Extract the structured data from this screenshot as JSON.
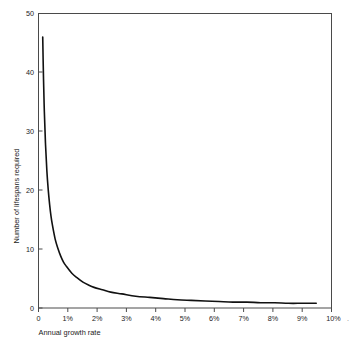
{
  "chart_data": {
    "type": "line",
    "title": "",
    "xlabel": "Annual growth rate",
    "ylabel": "Number of lifespans required",
    "xlim": [
      0,
      10.55
    ],
    "ylim": [
      0,
      50
    ],
    "grid": false,
    "legend": "none",
    "x_tick_labels": [
      "0",
      "1%",
      "2%",
      "3%",
      "4%",
      "5%",
      "6%",
      "7%",
      "8%",
      "9%",
      "10%"
    ],
    "x_tick_values": [
      0,
      1,
      2,
      3,
      4,
      5,
      6,
      7,
      8,
      9,
      10
    ],
    "y_tick_labels": [
      "0",
      "10",
      "20",
      "30",
      "40",
      "50"
    ],
    "y_tick_values": [
      0,
      10,
      20,
      30,
      40,
      50
    ],
    "series": [
      {
        "name": "Lifespans required",
        "x": [
          0.152,
          0.18,
          0.21,
          0.25,
          0.3,
          0.35,
          0.4,
          0.45,
          0.5,
          0.6,
          0.7,
          0.8,
          0.9,
          1.0,
          1.2,
          1.4,
          1.6,
          1.8,
          2.0,
          2.3,
          2.6,
          3.0,
          3.5,
          4.0,
          4.5,
          5.0,
          5.5,
          6.0,
          6.5,
          7.0,
          7.5,
          8.0,
          8.5,
          9.0,
          9.5,
          10.0
        ],
        "values": [
          46.0,
          39.0,
          33.4,
          28.1,
          23.4,
          20.1,
          17.6,
          15.6,
          14.1,
          11.7,
          10.1,
          8.8,
          7.8,
          7.1,
          5.9,
          5.1,
          4.4,
          3.9,
          3.5,
          3.1,
          2.7,
          2.4,
          2.0,
          1.8,
          1.6,
          1.4,
          1.3,
          1.2,
          1.1,
          1.0,
          1.0,
          0.9,
          0.9,
          0.8,
          0.8,
          0.8
        ],
        "annotation": "hyperbolic decay, approximately y = 7 / x"
      }
    ],
    "colors": {
      "curve": "#111111",
      "frame": "#4a4a4a",
      "background": "#ffffff",
      "text": "#1b1b1b"
    }
  },
  "axes": {
    "x_title": "Annual growth rate",
    "y_title": "Number of lifespans required",
    "trailing_artifact": "."
  }
}
